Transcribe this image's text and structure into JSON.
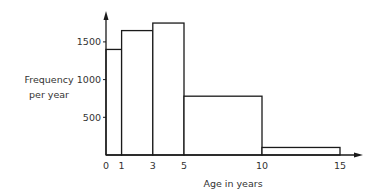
{
  "chart_data": {
    "type": "bar",
    "subtype": "histogram",
    "title": "",
    "xlabel": "Age in years",
    "ylabel": "Frequency per year",
    "ylabel_lines": [
      "Frequency",
      "per year"
    ],
    "bins": [
      {
        "from": 0,
        "to": 1,
        "value": 1400
      },
      {
        "from": 1,
        "to": 3,
        "value": 1650
      },
      {
        "from": 3,
        "to": 5,
        "value": 1750
      },
      {
        "from": 5,
        "to": 10,
        "value": 780
      },
      {
        "from": 10,
        "to": 15,
        "value": 100
      }
    ],
    "categories": [
      "0-1",
      "1-3",
      "3-5",
      "5-10",
      "10-15"
    ],
    "values": [
      1400,
      1650,
      1750,
      780,
      100
    ],
    "x_ticks": [
      0,
      1,
      3,
      5,
      10,
      15
    ],
    "x_tick_labels": [
      "0",
      "1",
      "3",
      "5",
      "10",
      "15"
    ],
    "y_ticks": [
      500,
      1000,
      1500
    ],
    "y_tick_labels": [
      "500",
      "1000",
      "1500"
    ],
    "xlim": [
      0,
      16
    ],
    "ylim": [
      0,
      1900
    ],
    "grid": false,
    "legend": null,
    "colors": {
      "line": "#1a1a1a",
      "fill": "#ffffff"
    }
  }
}
